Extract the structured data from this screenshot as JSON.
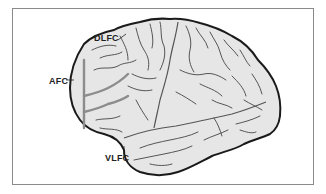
{
  "diagram": {
    "type": "brain-lateral-view",
    "labels": [
      {
        "id": "dlfc",
        "text": "DLFC"
      },
      {
        "id": "afc",
        "text": "AFC"
      },
      {
        "id": "vlfc",
        "text": "VLFC"
      }
    ],
    "colors": {
      "brain_fill": "#e6e6e6",
      "outline": "#1a1a1a",
      "sulci": "#555555",
      "highlight_sulcus": "#8c8c8c",
      "frame_border": "#8a8a8a"
    }
  }
}
